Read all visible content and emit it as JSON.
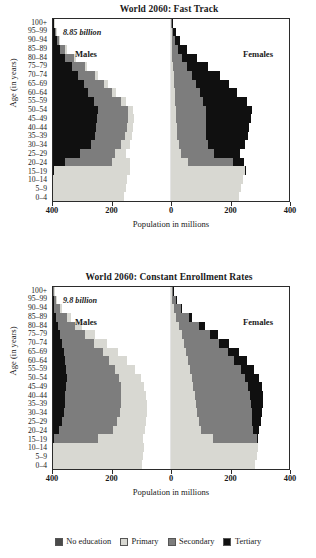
{
  "figure": {
    "axis": {
      "xlabel": "Population in millions",
      "ylabel": "Age (in years)",
      "xticks": [
        "400",
        "200",
        "0",
        "200",
        "400"
      ],
      "age_groups": [
        "0–4",
        "5–9",
        "10–14",
        "15–19",
        "20–24",
        "25–29",
        "30–34",
        "35–39",
        "40–44",
        "45–49",
        "50–54",
        "55–59",
        "60–64",
        "65–69",
        "70–74",
        "75–79",
        "80–84",
        "85–89",
        "90–94",
        "95–99",
        "100+"
      ],
      "male_label": "Males",
      "female_label": "Females"
    },
    "legend": {
      "items": [
        {
          "label": "No education",
          "color": "#4a4a4a"
        },
        {
          "label": "Primary",
          "color": "#d8d8d2"
        },
        {
          "label": "Secondary",
          "color": "#7d7d7d"
        },
        {
          "label": "Tertiary",
          "color": "#101010"
        }
      ]
    }
  },
  "chart_data": [
    {
      "type": "bar",
      "orientation": "population-pyramid",
      "title": "World 2060: Fast Track",
      "annotation": "8.85 billion",
      "xlabel": "Population in millions",
      "ylabel": "Age (in years)",
      "xlim": [
        -400,
        400
      ],
      "xticks": [
        -400,
        -200,
        0,
        200,
        400
      ],
      "grid": false,
      "legend_position": "bottom",
      "categories": [
        "0–4",
        "5–9",
        "10–14",
        "15–19",
        "20–24",
        "25–29",
        "30–34",
        "35–39",
        "40–44",
        "45–49",
        "50–54",
        "55–59",
        "60–64",
        "65–69",
        "70–74",
        "75–79",
        "80–84",
        "85–89",
        "90–94",
        "95–99",
        "100+"
      ],
      "series": [
        {
          "name": "Males: Primary",
          "values": [
            240,
            248,
            252,
            258,
            60,
            36,
            28,
            24,
            22,
            20,
            18,
            16,
            14,
            12,
            10,
            8,
            6,
            4,
            3,
            2,
            1
          ]
        },
        {
          "name": "Males: Secondary",
          "values": [
            0,
            0,
            0,
            0,
            160,
            118,
            104,
            102,
            104,
            104,
            100,
            92,
            80,
            70,
            58,
            44,
            30,
            18,
            10,
            5,
            2
          ]
        },
        {
          "name": "Males: No education",
          "values": [
            0,
            0,
            0,
            0,
            0,
            0,
            0,
            0,
            0,
            0,
            0,
            0,
            0,
            0,
            0,
            0,
            0,
            0,
            0,
            0,
            0
          ]
        },
        {
          "name": "Males: Tertiary",
          "values": [
            0,
            0,
            0,
            2,
            40,
            92,
            128,
            142,
            146,
            150,
            154,
            140,
            120,
            104,
            86,
            64,
            42,
            24,
            12,
            6,
            2
          ]
        },
        {
          "name": "Females: Primary",
          "values": [
            230,
            238,
            244,
            250,
            58,
            34,
            26,
            22,
            20,
            18,
            17,
            15,
            13,
            11,
            9,
            7,
            5,
            4,
            3,
            2,
            1
          ]
        },
        {
          "name": "Females: Secondary",
          "values": [
            0,
            0,
            0,
            0,
            152,
            112,
            100,
            98,
            100,
            102,
            100,
            94,
            84,
            74,
            62,
            48,
            34,
            21,
            12,
            6,
            3
          ]
        },
        {
          "name": "Females: No education",
          "values": [
            0,
            0,
            0,
            0,
            0,
            0,
            0,
            0,
            0,
            0,
            0,
            0,
            0,
            0,
            0,
            0,
            0,
            0,
            0,
            0,
            0
          ]
        },
        {
          "name": "Females: Tertiary",
          "values": [
            0,
            0,
            0,
            2,
            38,
            88,
            124,
            140,
            146,
            152,
            158,
            148,
            128,
            112,
            94,
            72,
            50,
            30,
            16,
            8,
            3
          ]
        }
      ]
    },
    {
      "type": "bar",
      "orientation": "population-pyramid",
      "title": "World 2060: Constant Enrollment Rates",
      "annotation": "9.8 billion",
      "xlabel": "Population in millions",
      "ylabel": "Age (in years)",
      "xlim": [
        -400,
        400
      ],
      "xticks": [
        -400,
        -200,
        0,
        200,
        400
      ],
      "grid": false,
      "legend_position": "bottom",
      "categories": [
        "0–4",
        "5–9",
        "10–14",
        "15–19",
        "20–24",
        "25–29",
        "30–34",
        "35–39",
        "40–44",
        "45–49",
        "50–54",
        "55–59",
        "60–64",
        "65–69",
        "70–74",
        "75–79",
        "80–84",
        "85–89",
        "90–94",
        "95–99",
        "100+"
      ],
      "series": [
        {
          "name": "Males: Primary",
          "values": [
            300,
            305,
            308,
            150,
            108,
            98,
            92,
            88,
            84,
            80,
            74,
            68,
            60,
            52,
            44,
            34,
            24,
            14,
            8,
            4,
            2
          ]
        },
        {
          "name": "Males: Secondary",
          "values": [
            0,
            0,
            0,
            150,
            182,
            186,
            190,
            192,
            190,
            186,
            178,
            166,
            150,
            132,
            110,
            86,
            60,
            36,
            18,
            8,
            3
          ]
        },
        {
          "name": "Males: No education",
          "values": [
            0,
            0,
            0,
            0,
            0,
            0,
            0,
            0,
            0,
            0,
            0,
            0,
            0,
            0,
            0,
            0,
            0,
            0,
            0,
            0,
            0
          ]
        },
        {
          "name": "Males: Tertiary",
          "values": [
            0,
            0,
            0,
            4,
            22,
            30,
            36,
            40,
            42,
            44,
            46,
            44,
            40,
            36,
            30,
            24,
            16,
            10,
            5,
            2,
            1
          ]
        },
        {
          "name": "Females: Primary",
          "values": [
            285,
            292,
            296,
            142,
            102,
            94,
            88,
            84,
            80,
            76,
            72,
            66,
            58,
            52,
            44,
            36,
            26,
            16,
            9,
            5,
            2
          ]
        },
        {
          "name": "Females: Secondary",
          "values": [
            0,
            0,
            0,
            148,
            176,
            182,
            186,
            188,
            188,
            186,
            180,
            170,
            156,
            140,
            120,
            96,
            70,
            44,
            24,
            11,
            4
          ]
        },
        {
          "name": "Females: No education",
          "values": [
            0,
            0,
            0,
            0,
            0,
            0,
            0,
            0,
            0,
            0,
            0,
            0,
            0,
            0,
            0,
            0,
            0,
            0,
            0,
            0,
            0
          ]
        },
        {
          "name": "Females: Tertiary",
          "values": [
            0,
            0,
            0,
            4,
            22,
            30,
            36,
            40,
            44,
            46,
            48,
            46,
            42,
            38,
            32,
            26,
            18,
            11,
            6,
            3,
            1
          ]
        }
      ]
    }
  ]
}
